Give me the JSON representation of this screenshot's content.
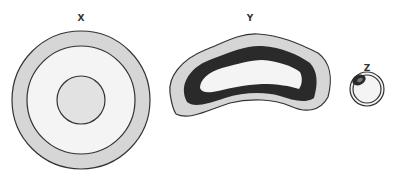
{
  "diagram": {
    "type": "cell cross-sections",
    "cells": [
      {
        "label": "X",
        "shape": "circular",
        "layers": [
          "outer light-gray wall",
          "white interior",
          "central light-gray nucleus"
        ]
      },
      {
        "label": "Y",
        "shape": "kidney/bean",
        "layers": [
          "outer light-gray layer",
          "thick dark layer",
          "white interior"
        ]
      },
      {
        "label": "Z",
        "shape": "small ring",
        "layers": [
          "thin double ring",
          "dark crescent at top-left",
          "white interior"
        ]
      }
    ],
    "colors": {
      "light_gray": "#d6d6d6",
      "dark": "#2a2a2a",
      "interior": "#f4f4f4",
      "outline": "#333333"
    }
  }
}
